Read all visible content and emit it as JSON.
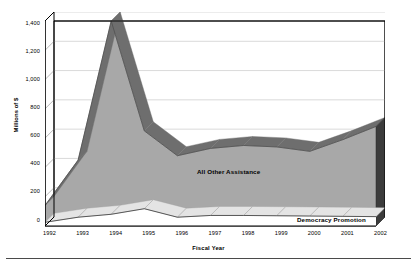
{
  "chart_data": {
    "type": "area",
    "stacked": true,
    "title": "",
    "subtitle": "",
    "xlabel": "Fiscal Year",
    "ylabel": "Millions of $",
    "x": [
      1992,
      1993,
      1994,
      1995,
      1996,
      1997,
      1998,
      1999,
      2000,
      2001,
      2002
    ],
    "categories": [
      "1992",
      "1993",
      "1994",
      "1995",
      "1996",
      "1997",
      "1998",
      "1999",
      "2000",
      "2001",
      "2002"
    ],
    "series": [
      {
        "name": "Democracy Promotion",
        "values": [
          25,
          60,
          80,
          118,
          60,
          72,
          72,
          70,
          68,
          66,
          64
        ]
      },
      {
        "name": "All Other Assistance",
        "values": [
          115,
          390,
          1320,
          532,
          420,
          458,
          478,
          470,
          442,
          524,
          616
        ]
      }
    ],
    "totals": [
      140,
      450,
      1400,
      650,
      480,
      530,
      550,
      540,
      510,
      590,
      680
    ],
    "ylim": [
      0,
      1400
    ],
    "ytick_values": [
      0,
      200,
      400,
      600,
      800,
      1000,
      1200,
      1400
    ],
    "ytick_labels": [
      "0",
      "200",
      "400",
      "600",
      "800",
      "1,000",
      "1,200",
      "1,400"
    ],
    "xtick_labels": [
      "1992",
      "1993",
      "1994",
      "1995",
      "1996",
      "1997",
      "1998",
      "1999",
      "2000",
      "2001",
      "2002"
    ],
    "grid": true,
    "grid_axis": "y",
    "legend": "inline-annotations",
    "annotations": [
      {
        "text": "All Other Assistance",
        "series": "All Other Assistance"
      },
      {
        "text": "Democracy Promotion",
        "series": "Democracy Promotion"
      }
    ],
    "style": "3d-area",
    "colors": {
      "area_fill": "#a8a8a8",
      "area_top_face": "#6e6e6e",
      "area_side_face": "#3c3c3c",
      "democracy_fill": "#ffffff",
      "axis": "#000000",
      "grid": "#c9c9c9",
      "text": "#000000",
      "background": "#ffffff"
    }
  },
  "figure": {
    "y_axis_title": "Millions of $",
    "x_axis_title": "Fiscal Year"
  }
}
